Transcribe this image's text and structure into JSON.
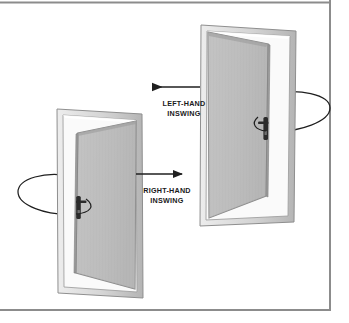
{
  "figure": {
    "background_color": "#ffffff",
    "border_color": "#8c8c8c"
  },
  "labels": {
    "left_hand": {
      "line1": "LEFT-HAND",
      "line2": "INSWING"
    },
    "right_hand": {
      "line1": "RIGHT-HAND",
      "line2": "INSWING"
    }
  },
  "colors": {
    "frame_light": "#e3e3e3",
    "frame_mid": "#c9c9c9",
    "frame_dark": "#a8a8a8",
    "panel_fill": "#bdbdbd",
    "panel_edge": "#8f8f8f",
    "outline": "#6f6f6f",
    "arrow": "#1f1f1f",
    "hardware": "#2b2b2b",
    "text": "#1a1a1a"
  },
  "doors": [
    {
      "id": "left-hand-inswing-door",
      "label_key": "left_hand",
      "hinge_side": "left",
      "swing_direction": "left",
      "position": "upper-right"
    },
    {
      "id": "right-hand-inswing-door",
      "label_key": "right_hand",
      "hinge_side": "right",
      "swing_direction": "right",
      "position": "lower-left"
    }
  ],
  "arrows": [
    {
      "id": "left-hand-arrow",
      "points": "left"
    },
    {
      "id": "right-hand-arrow",
      "points": "right"
    }
  ],
  "swing_arcs": [
    {
      "id": "left-hand-swing-arc"
    },
    {
      "id": "right-hand-swing-arc"
    }
  ]
}
